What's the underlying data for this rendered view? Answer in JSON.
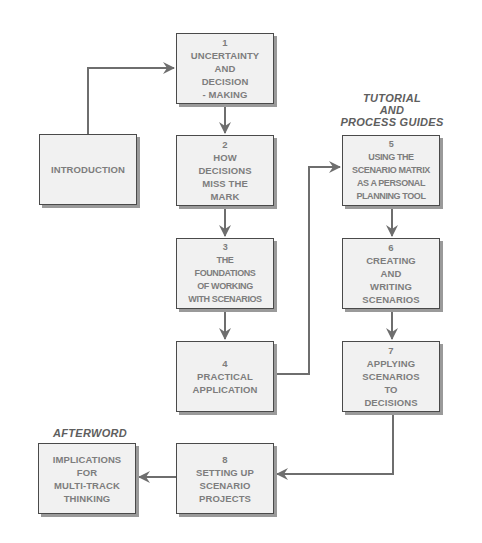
{
  "diagram": {
    "section_labels": {
      "tutorial": [
        "TUTORIAL",
        "AND",
        "PROCESS GUIDES"
      ],
      "afterword": "AFTERWORD"
    },
    "boxes": {
      "introduction": {
        "lines": [
          "INTRODUCTION"
        ]
      },
      "ch1": {
        "number": "1",
        "lines": [
          "UNCERTAINTY",
          "AND",
          "DECISION",
          "- MAKING"
        ]
      },
      "ch2": {
        "number": "2",
        "lines": [
          "HOW",
          "DECISIONS",
          "MISS THE",
          "MARK"
        ]
      },
      "ch3": {
        "number": "3",
        "lines": [
          "THE",
          "FOUNDATIONS",
          "OF WORKING",
          "WITH SCENARIOS"
        ]
      },
      "ch4": {
        "number": "4",
        "lines": [
          "PRACTICAL",
          "APPLICATION"
        ]
      },
      "ch5": {
        "number": "5",
        "lines": [
          "USING THE",
          "SCENARIO MATRIX",
          "AS A PERSONAL",
          "PLANNING TOOL"
        ]
      },
      "ch6": {
        "number": "6",
        "lines": [
          "CREATING",
          "AND",
          "WRITING",
          "SCENARIOS"
        ]
      },
      "ch7": {
        "number": "7",
        "lines": [
          "APPLYING",
          "SCENARIOS",
          "TO",
          "DECISIONS"
        ]
      },
      "ch8": {
        "number": "8",
        "lines": [
          "SETTING UP",
          "SCENARIO",
          "PROJECTS"
        ]
      },
      "afterword": {
        "lines": [
          "IMPLICATIONS",
          "FOR",
          "MULTI-TRACK",
          "THINKING"
        ]
      }
    },
    "connections": [
      {
        "from": "introduction",
        "to": "ch1"
      },
      {
        "from": "ch1",
        "to": "ch2"
      },
      {
        "from": "ch2",
        "to": "ch3"
      },
      {
        "from": "ch3",
        "to": "ch4"
      },
      {
        "from": "ch4",
        "to": "ch5"
      },
      {
        "from": "ch5",
        "to": "ch6"
      },
      {
        "from": "ch6",
        "to": "ch7"
      },
      {
        "from": "ch7",
        "to": "ch8"
      },
      {
        "from": "ch8",
        "to": "afterword"
      }
    ],
    "colors": {
      "box_fill": "#f1f1f1",
      "box_border": "#4a4a4a",
      "box_text": "#7d7d7d",
      "connector": "#6e6e6e",
      "label_text": "#5e5e5e"
    }
  }
}
